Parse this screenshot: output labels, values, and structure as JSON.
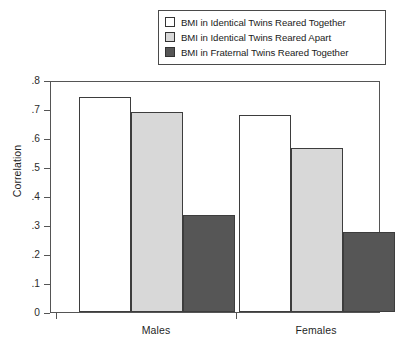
{
  "chart_data": {
    "type": "bar",
    "title": "",
    "subtitle": "",
    "xlabel": "",
    "ylabel": "Correlation",
    "categories": [
      "Males",
      "Females"
    ],
    "ylim": [
      0,
      0.8
    ],
    "yticks": [
      {
        "value": 0.8,
        "label": ".8"
      },
      {
        "value": 0.7,
        "label": ".7"
      },
      {
        "value": 0.6,
        "label": ".6"
      },
      {
        "value": 0.5,
        "label": ".5"
      },
      {
        "value": 0.4,
        "label": ".4"
      },
      {
        "value": 0.3,
        "label": ".3"
      },
      {
        "value": 0.2,
        "label": ".2"
      },
      {
        "value": 0.1,
        "label": ".1"
      },
      {
        "value": 0.0,
        "label": "0"
      }
    ],
    "grid": false,
    "legend_position": "top-right",
    "series": [
      {
        "name": "BMI in Identical Twins Reared Together",
        "color": "#ffffff",
        "values": [
          0.74,
          0.68
        ]
      },
      {
        "name": "BMI in Identical Twins Reared Apart",
        "color": "#d8d8d8",
        "values": [
          0.69,
          0.565
        ]
      },
      {
        "name": "BMI in Fraternal Twins Reared Together",
        "color": "#565656",
        "values": [
          0.335,
          0.275
        ]
      }
    ]
  },
  "legend": {
    "items": [
      {
        "label": "BMI in Identical Twins Reared Together",
        "color": "#ffffff"
      },
      {
        "label": "BMI in Identical Twins Reared Apart",
        "color": "#d8d8d8"
      },
      {
        "label": "BMI in Fraternal Twins Reared Together",
        "color": "#565656"
      }
    ]
  },
  "axes": {
    "y_title": "Correlation",
    "y_tick_labels": [
      ".8",
      ".7",
      ".6",
      ".5",
      ".4",
      ".3",
      ".2",
      ".1",
      "0"
    ],
    "x_tick_labels": [
      "Males",
      "Females"
    ]
  },
  "colors": {
    "bar_identical_together": "#ffffff",
    "bar_identical_apart": "#d8d8d8",
    "bar_fraternal_together": "#565656",
    "axis": "#555555",
    "outline": "#3d3d3d",
    "text": "#1f1f1f"
  }
}
